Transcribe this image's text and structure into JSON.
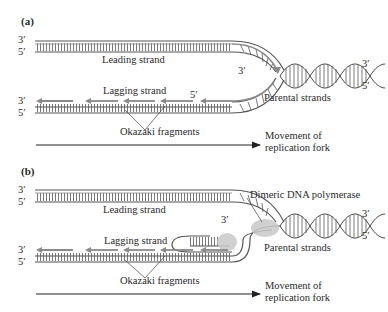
{
  "figure": {
    "panels": [
      {
        "id": "a",
        "label": "(a)",
        "leading_3": "3′",
        "leading_5": "5′",
        "leading_strand": "Leading strand",
        "fork_3": "3′",
        "lagging_strand": "Lagging strand",
        "lagging_5_fork": "5′",
        "lagging_3": "3′",
        "lagging_5": "5′",
        "okazaki": "Okazaki fragments",
        "parental_strands": "Parental strands",
        "parental_3": "3′",
        "parental_5": "5′",
        "movement_line1": "Movement of",
        "movement_line2": "replication fork"
      },
      {
        "id": "b",
        "label": "(b)",
        "leading_3": "3′",
        "leading_5": "5′",
        "leading_strand": "Leading strand",
        "fork_3": "3′",
        "polymerase": "Dimeric DNA polymerase",
        "lagging_strand": "Lagging strand",
        "lagging_3": "3′",
        "lagging_5": "5′",
        "okazaki": "Okazaki fragments",
        "parental_strands": "Parental strands",
        "parental_3": "3′",
        "parental_5": "5′",
        "movement_line1": "Movement of",
        "movement_line2": "replication fork"
      }
    ],
    "colors": {
      "strand": "#555555",
      "new_strand": "#8a8a8a",
      "polymerase": "#c8c8c8",
      "text": "#2a2a2a"
    }
  }
}
